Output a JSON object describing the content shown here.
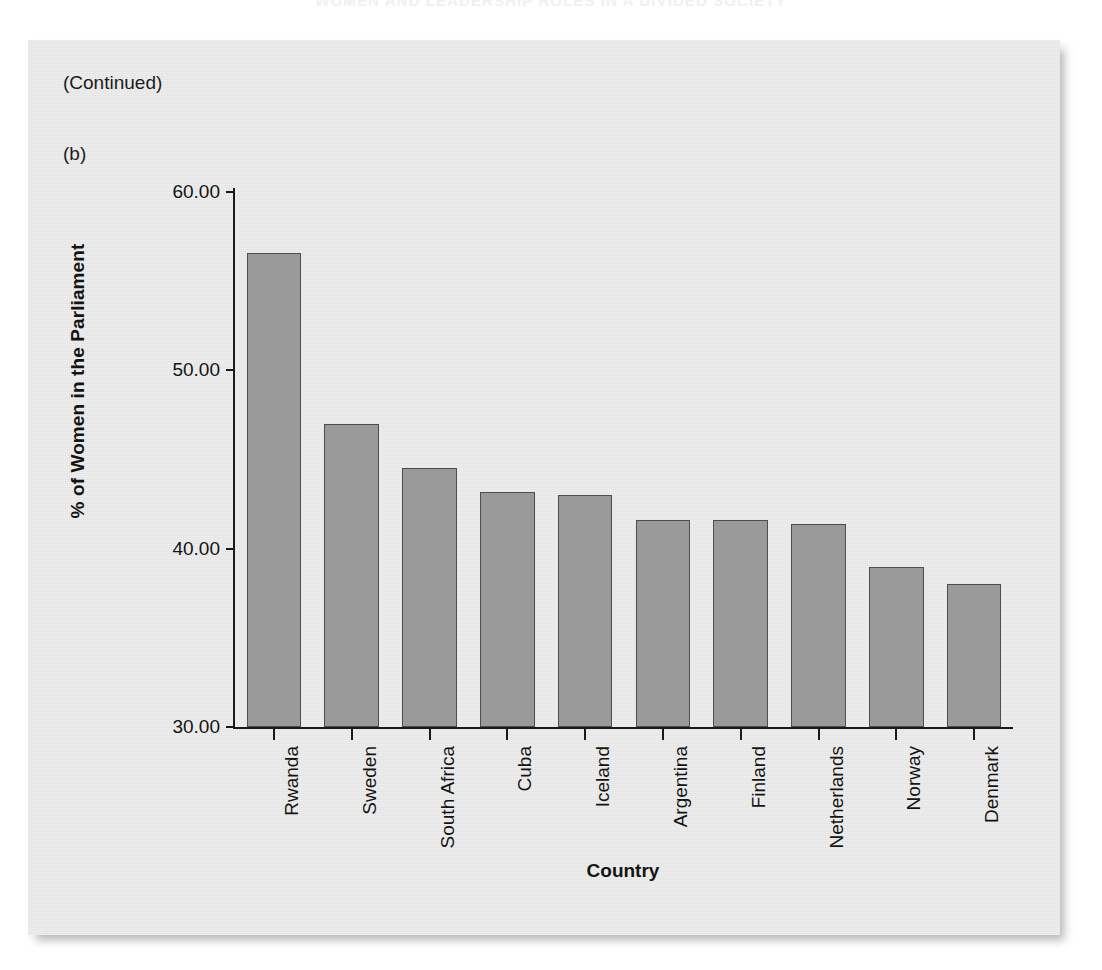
{
  "page": {
    "running_header": "WOMEN AND LEADERSHIP ROLES IN A DIVIDED SOCIETY",
    "continued_label": "(Continued)",
    "panel_label": "(b)"
  },
  "colors": {
    "card_background": "#e9e9e9",
    "bar_fill": "#9a9a9a",
    "bar_border": "#4e4e4e",
    "axis": "#1a1a1a",
    "text": "#141414"
  },
  "chart_data": {
    "type": "bar",
    "title": "",
    "xlabel": "Country",
    "ylabel": "% of Women in the Parliament",
    "categories": [
      "Rwanda",
      "Sweden",
      "South Africa",
      "Cuba",
      "Iceland",
      "Argentina",
      "Finland",
      "Netherlands",
      "Norway",
      "Denmark"
    ],
    "values": [
      56.6,
      47.0,
      44.5,
      43.2,
      43.0,
      41.6,
      41.6,
      41.4,
      39.0,
      38.0
    ],
    "ylim": [
      30.0,
      60.0
    ],
    "yticks": [
      30.0,
      40.0,
      50.0,
      60.0
    ],
    "ytick_labels": [
      "30.00",
      "40.00",
      "50.00",
      "60.00"
    ],
    "grid": false,
    "legend": null
  }
}
